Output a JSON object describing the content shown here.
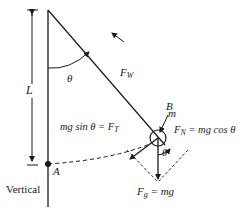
{
  "diagram": {
    "type": "pendulum free-body diagram",
    "labels": {
      "length": "L",
      "angle_top": "θ",
      "angle_bob": "θ",
      "tension_force": "F",
      "tension_sub": "W",
      "point_b": "B",
      "mass": "m",
      "tangential_lhs": "mg sin θ = F",
      "tangential_sub": "T",
      "normal_f": "F",
      "normal_sub": "N",
      "normal_rhs": " = mg cos θ",
      "gravity_f": "F",
      "gravity_sub": "g",
      "gravity_rhs": " = mg",
      "point_a": "A",
      "vertical": "Vertical"
    },
    "colors": {
      "ink": "#1a1a1a",
      "background": "#ffffff"
    }
  }
}
